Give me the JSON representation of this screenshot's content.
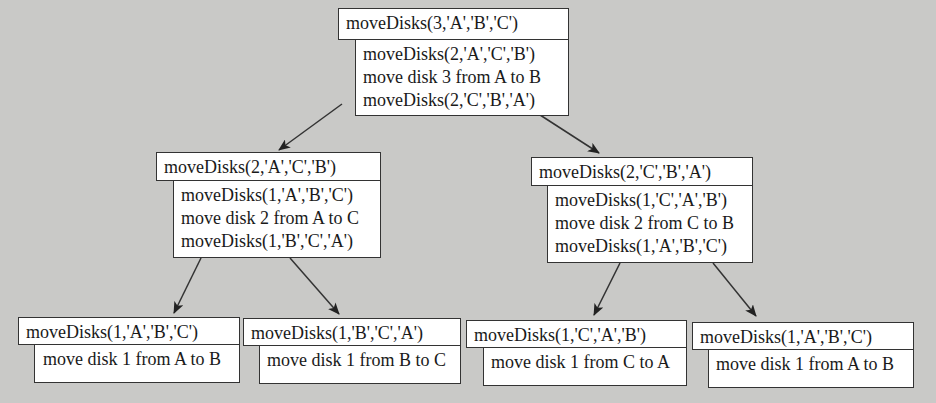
{
  "diagram": {
    "background": "#c9c9c7",
    "nodes": {
      "root": {
        "call": "moveDisks(3,'A','B','C')",
        "steps": [
          "moveDisks(2,'A','C','B')",
          "move disk 3 from A to B",
          "moveDisks(2,'C','B','A')"
        ]
      },
      "left": {
        "call": "moveDisks(2,'A','C','B')",
        "steps": [
          "moveDisks(1,'A','B','C')",
          "move disk 2 from A to C",
          "moveDisks(1,'B','C','A')"
        ]
      },
      "right": {
        "call": "moveDisks(2,'C','B','A')",
        "steps": [
          "moveDisks(1,'C','A','B')",
          "move disk 2 from C to B",
          "moveDisks(1,'A','B','C')"
        ]
      },
      "leaf1": {
        "call": "moveDisks(1,'A','B','C')",
        "steps": [
          "move disk 1 from A to B"
        ]
      },
      "leaf2": {
        "call": "moveDisks(1,'B','C','A')",
        "steps": [
          "move disk 1 from B to C"
        ]
      },
      "leaf3": {
        "call": "moveDisks(1,'C','A','B')",
        "steps": [
          "move disk 1 from C to A"
        ]
      },
      "leaf4": {
        "call": "moveDisks(1,'A','B','C')",
        "steps": [
          "move disk 1 from A to B"
        ]
      }
    },
    "edges": [
      [
        "root",
        "left"
      ],
      [
        "root",
        "right"
      ],
      [
        "left",
        "leaf1"
      ],
      [
        "left",
        "leaf2"
      ],
      [
        "right",
        "leaf3"
      ],
      [
        "right",
        "leaf4"
      ]
    ]
  }
}
